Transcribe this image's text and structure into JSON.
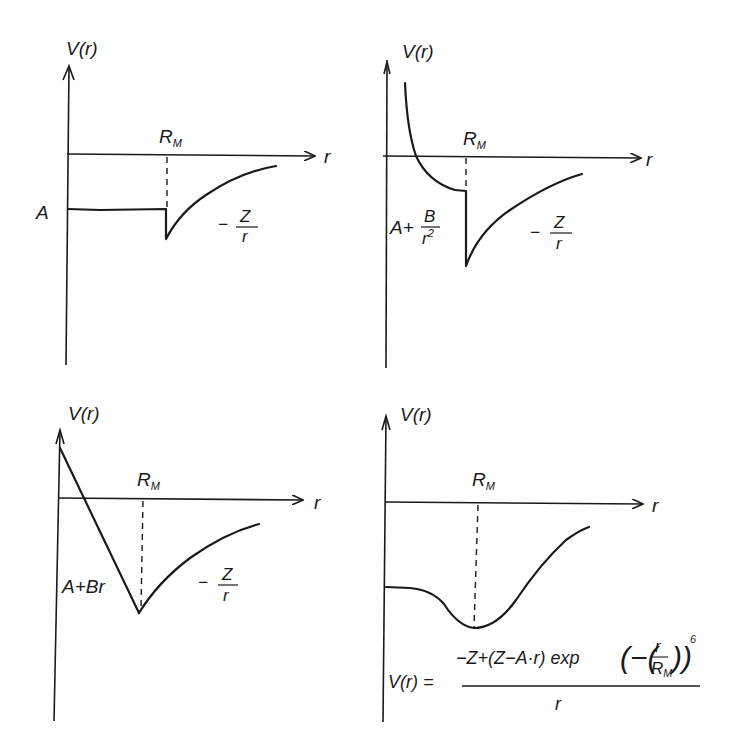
{
  "panels": [
    {
      "id": "step",
      "y_axis_label": "V(r)",
      "x_axis_label": "r",
      "marker_label": "R",
      "marker_sub": "M",
      "inner_label": "A",
      "outer_label_num": "Z",
      "outer_label_den": "r",
      "outer_label_sign": "−"
    },
    {
      "id": "inverse-square",
      "y_axis_label": "V(r)",
      "x_axis_label": "r",
      "marker_label": "R",
      "marker_sub": "M",
      "inner_label_prefix": "A+",
      "inner_label_num": "B",
      "inner_label_den": "r",
      "inner_label_den_exp": "2",
      "outer_label_num": "Z",
      "outer_label_den": "r",
      "outer_label_sign": "−"
    },
    {
      "id": "linear",
      "y_axis_label": "V(r)",
      "x_axis_label": "r",
      "marker_label": "R",
      "marker_sub": "M",
      "inner_label": "A+Br",
      "outer_label_num": "Z",
      "outer_label_den": "r",
      "outer_label_sign": "−"
    },
    {
      "id": "smooth",
      "y_axis_label": "V(r)",
      "x_axis_label": "r",
      "marker_label": "R",
      "marker_sub": "M",
      "formula_lhs": "V(r) =",
      "formula_num": "−Z+(Z−A·r) exp",
      "formula_inner_open": "(−(",
      "formula_frac_num": "r",
      "formula_frac_den": "R",
      "formula_frac_den_sub": "M",
      "formula_inner_close": "))",
      "formula_exp": "6",
      "formula_den": "r"
    }
  ]
}
